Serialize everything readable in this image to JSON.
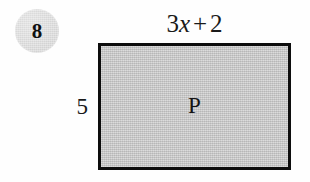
{
  "figure": {
    "problem_number": "8",
    "background_color": "#fefefe"
  },
  "shape": {
    "type": "rectangle",
    "interior_label": "P",
    "fill_color": "#c2c2c2",
    "border_color": "#0d0d0d"
  },
  "labels": {
    "top_dimension": {
      "full_text": "3x + 2",
      "coefficient": "3",
      "variable": "x",
      "operator": "+",
      "constant": "2"
    },
    "left_dimension": "5"
  }
}
